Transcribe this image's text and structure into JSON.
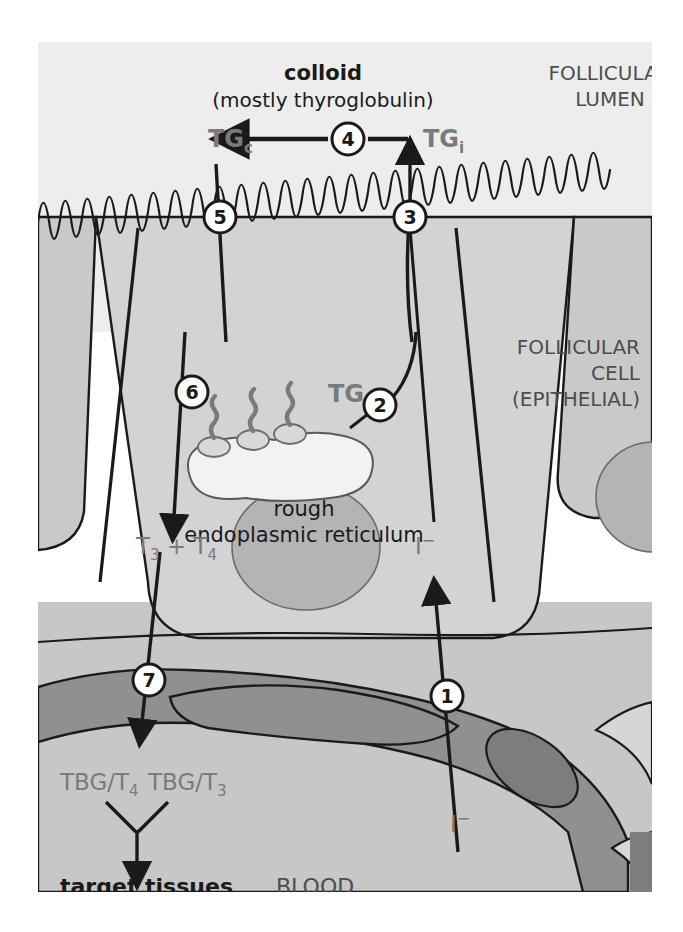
{
  "figure": {
    "title_main": "colloid",
    "title_sub": "(mostly thyroglobulin)",
    "region_lumen_line1": "FOLLICULAR",
    "region_lumen_line2": "LUMEN",
    "region_cell_line1": "FOLLICULAR",
    "region_cell_line2": "CELL",
    "region_cell_line3": "(EPITHELIAL)",
    "region_blood": "BLOOD"
  },
  "labels": {
    "tg_colloid": "TG",
    "tg_colloid_sub": "c",
    "tg_iodinated": "TG",
    "tg_iodinated_sub": "i",
    "tg_plain": "TG",
    "rer_line1": "rough",
    "rer_line2": "endoplasmic reticulum",
    "hormones": "T",
    "hormones_sub1": "3",
    "hormones_plus": " + T",
    "hormones_sub2": "4",
    "hormones_full": "T3 + T4",
    "tbg_t4": "TBG/T",
    "tbg_t4_sub": "4",
    "tbg_t3": "TBG/T",
    "tbg_t3_sub": "3",
    "target": "target tissues",
    "iodide_cell": "I",
    "iodide_cell_sup": "−",
    "iodide_blood": "I",
    "iodide_blood_sup": "−"
  },
  "steps": [
    {
      "id": "1",
      "number": "1",
      "description": "iodide trapping from blood"
    },
    {
      "id": "2",
      "number": "2",
      "description": "thyroglobulin transport from rough ER"
    },
    {
      "id": "3",
      "number": "3",
      "description": "TGi secretion into colloid"
    },
    {
      "id": "4",
      "number": "4",
      "description": "iodination in colloid"
    },
    {
      "id": "5",
      "number": "5",
      "description": "endocytosis of TGc"
    },
    {
      "id": "6",
      "number": "6",
      "description": "proteolysis releasing T3 and T4"
    },
    {
      "id": "7",
      "number": "7",
      "description": "release into blood"
    }
  ],
  "colors": {
    "page_background": "#ffffff",
    "lumen_fill": "#ededed",
    "cell_fill": "#d3d3d3",
    "cell_fill_right": "#c9c9c9",
    "nucleus_fill": "#b4b4b4",
    "blood_plasma": "#c7c7c7",
    "capillary_wall": "#909090",
    "endothelial_nucleus": "#7d7d7d",
    "rer_fill": "#f2f2f2",
    "text_dark": "#1a1a1a",
    "text_gray": "#7a7a7a",
    "stroke": "#1a1a1a",
    "ribosome": "#8a8a8a"
  }
}
